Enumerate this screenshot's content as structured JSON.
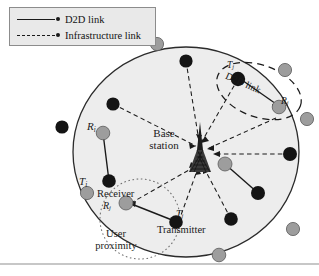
{
  "figure": {
    "type": "diagram",
    "legend": {
      "items": [
        {
          "id": "d2d",
          "label": "D2D link",
          "line_style": "solid",
          "marker": "dot",
          "color": "#1a1a1a"
        },
        {
          "id": "infra",
          "label": "Infrastructure link",
          "line_style": "dashed",
          "marker": "dot",
          "color": "#1a1a1a"
        }
      ]
    },
    "base_station": {
      "label_line1": "Base",
      "label_line2": "station",
      "icon": "cell-tower-icon"
    },
    "annotations": {
      "d2d_link_top": "D2D link",
      "receiver": "Receiver",
      "transmitter": "Transmitter",
      "user_proximity_line1": "User",
      "user_proximity_line2": "proximity"
    },
    "node_labels": {
      "rx_left": {
        "base": "R",
        "sub": "i"
      },
      "tx_left": {
        "base": "T",
        "sub": "i"
      },
      "tx_top": {
        "base": "T",
        "sub": "j"
      },
      "rx_top": {
        "base": "R",
        "sub": "j"
      },
      "rx_bottom": {
        "base": "R",
        "sub": "j"
      },
      "tx_bottom": {
        "base": "T",
        "sub": "j"
      }
    },
    "colors": {
      "cell_fill": "#ededed",
      "cell_stroke": "#2b2b2b",
      "node_dark": "#141414",
      "node_gray": "#9d9d9d",
      "node_gray_stroke": "#5a5a5a",
      "link": "#1a1a1a",
      "legend_fill": "#e9e9e9",
      "legend_border": "#8c8c8c",
      "rule": "#8f8f8f"
    }
  }
}
